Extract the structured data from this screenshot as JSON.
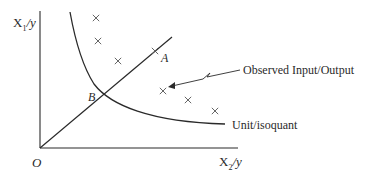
{
  "diagram": {
    "type": "isoquant-efficiency",
    "axes": {
      "y_label_main": "X",
      "y_label_sub": "1",
      "y_label_suffix": "/y",
      "x_label_main": "X",
      "x_label_sub": "2",
      "x_label_suffix": "/y",
      "origin_label": "O"
    },
    "points": {
      "A": "A",
      "B": "B"
    },
    "annotations": {
      "observed": "Observed Input/Output",
      "isoquant": "Unit/isoquant"
    },
    "observations": [
      {
        "x": 96,
        "y": 18
      },
      {
        "x": 98,
        "y": 41
      },
      {
        "x": 118,
        "y": 61
      },
      {
        "x": 155,
        "y": 51
      },
      {
        "x": 163,
        "y": 91
      },
      {
        "x": 188,
        "y": 100
      },
      {
        "x": 215,
        "y": 111
      }
    ],
    "colors": {
      "line": "#2a2a2a",
      "marker": "#555555"
    }
  }
}
